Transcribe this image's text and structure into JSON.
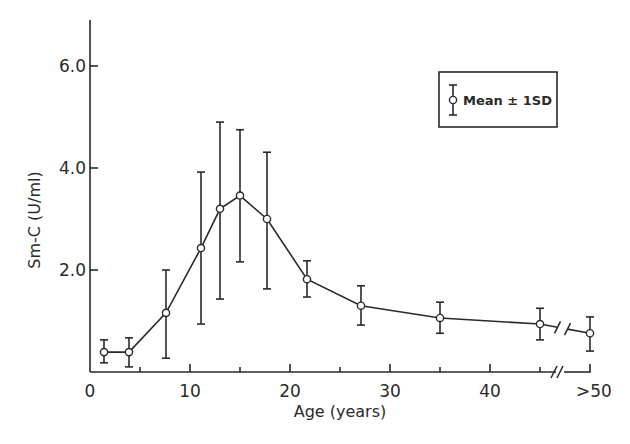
{
  "chart_data": {
    "type": "line",
    "title": "",
    "xlabel": "Age (years)",
    "ylabel": "Sm-C (U/ml)",
    "xlim": [
      0,
      50
    ],
    "ylim": [
      0,
      7.0
    ],
    "grid": false,
    "legend_position": "upper right",
    "x_ticks": [
      {
        "value": 0,
        "label": "0"
      },
      {
        "value": 10,
        "label": "10"
      },
      {
        "value": 20,
        "label": "20"
      },
      {
        "value": 30,
        "label": "30"
      },
      {
        "value": 40,
        "label": "40"
      },
      {
        "value": 50,
        "label": ">50"
      }
    ],
    "x_minor_ticks": [
      5,
      15,
      25,
      35,
      45
    ],
    "y_ticks": [
      {
        "value": 2.0,
        "label": "2.0"
      },
      {
        "value": 4.0,
        "label": "4.0"
      },
      {
        "value": 6.0,
        "label": "6.0"
      }
    ],
    "axis_break": {
      "x_between": [
        45,
        50
      ],
      "symbol": "//"
    },
    "series": [
      {
        "name": "Mean ± 1SD",
        "x": [
          1.4,
          3.9,
          7.6,
          11.1,
          13.0,
          15.0,
          17.7,
          21.7,
          27.1,
          35.0,
          45.0,
          ">50"
        ],
        "values": [
          0.39,
          0.39,
          1.16,
          2.43,
          3.2,
          3.46,
          3.0,
          1.82,
          1.3,
          1.06,
          0.94,
          0.76
        ],
        "upper": [
          0.63,
          0.67,
          2.0,
          3.92,
          4.9,
          4.75,
          4.31,
          2.18,
          1.69,
          1.37,
          1.25,
          1.08
        ],
        "lower": [
          0.18,
          0.1,
          0.27,
          0.94,
          1.43,
          2.16,
          1.63,
          1.47,
          0.92,
          0.76,
          0.63,
          0.41
        ]
      }
    ],
    "legend": [
      {
        "label": "Mean ± 1SD",
        "marker": "open-circle-with-error-bar"
      }
    ]
  },
  "labels": {
    "xlabel": "Age (years)",
    "ylabel": "Sm-C  (U/ml)",
    "legend": "Mean ± 1SD"
  },
  "colors": {
    "ink": "#2a2a2a",
    "background": "#ffffff"
  }
}
